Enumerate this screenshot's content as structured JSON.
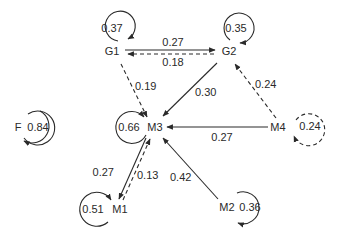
{
  "diagram": {
    "type": "directed-graph",
    "nodes": [
      {
        "id": "G1",
        "label": "G1",
        "self_loop": "0.37",
        "loop_style": "solid"
      },
      {
        "id": "G2",
        "label": "G2",
        "self_loop": "0.35",
        "loop_style": "solid"
      },
      {
        "id": "F",
        "label": "F",
        "self_loop": "0.84",
        "loop_style": "solid"
      },
      {
        "id": "M3",
        "label": "M3",
        "self_loop": "0.66",
        "loop_style": "solid"
      },
      {
        "id": "M4",
        "label": "M4",
        "self_loop": "0.24",
        "loop_style": "dashed"
      },
      {
        "id": "M1",
        "label": "M1",
        "self_loop": "0.51",
        "loop_style": "solid"
      },
      {
        "id": "M2",
        "label": "M2",
        "self_loop": "0.36",
        "loop_style": "solid"
      }
    ],
    "edges": [
      {
        "from": "G1",
        "to": "G2",
        "weight": "0.27",
        "style": "solid"
      },
      {
        "from": "G2",
        "to": "G1",
        "weight": "0.18",
        "style": "dashed"
      },
      {
        "from": "G1",
        "to": "M3",
        "weight": "0.19",
        "style": "dashed"
      },
      {
        "from": "G2",
        "to": "M3",
        "weight": "0.30",
        "style": "solid"
      },
      {
        "from": "M4",
        "to": "G2",
        "weight": "0.24",
        "style": "dashed"
      },
      {
        "from": "M4",
        "to": "M3",
        "weight": "0.27",
        "style": "solid"
      },
      {
        "from": "M3",
        "to": "M1",
        "weight": "0.27",
        "style": "solid"
      },
      {
        "from": "M1",
        "to": "M3",
        "weight": "0.13",
        "style": "dashed"
      },
      {
        "from": "M2",
        "to": "M3",
        "weight": "0.42",
        "style": "solid"
      }
    ]
  },
  "colors": {
    "stroke": "#2a2a2a",
    "background": "#ffffff"
  }
}
